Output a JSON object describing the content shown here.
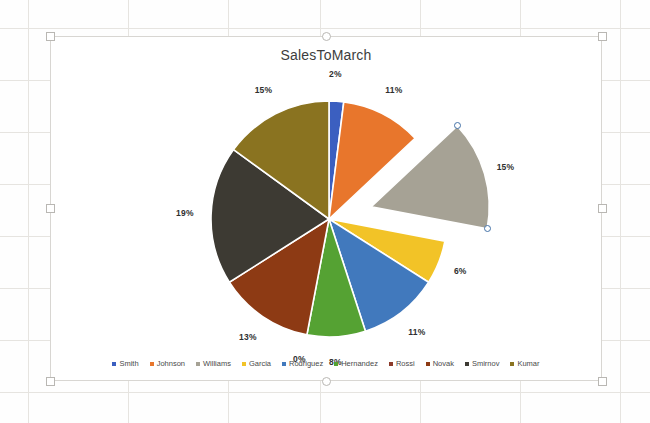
{
  "chart_data": {
    "type": "pie",
    "title": "SalesToMarch",
    "legend_position": "bottom",
    "categories": [
      "Smith",
      "Johnson",
      "Williams",
      "Garcia",
      "Rodriguez",
      "Hernandez",
      "Rossi",
      "Novak",
      "Smirnov",
      "Kumar"
    ],
    "values": [
      2,
      11,
      15,
      6,
      11,
      8,
      0,
      13,
      19,
      15
    ],
    "data_labels": [
      "2%",
      "11%",
      "15%",
      "6%",
      "11%",
      "8%",
      "0%",
      "13%",
      "19%",
      "15%"
    ],
    "colors": [
      "#3b5fc0",
      "#e8762c",
      "#a6a295",
      "#f2c327",
      "#4179bd",
      "#55a233",
      "#8c3a2a",
      "#8d3a14",
      "#3d3a33",
      "#8a7320"
    ],
    "exploded_slice": "Williams",
    "units": "percent"
  },
  "chart": {
    "title": "SalesToMarch",
    "slices": [
      {
        "name": "Smith",
        "label": "2%",
        "color": "#3b5fc0",
        "value": 2
      },
      {
        "name": "Johnson",
        "label": "11%",
        "color": "#e8762c",
        "value": 11
      },
      {
        "name": "Williams",
        "label": "15%",
        "color": "#a6a295",
        "value": 15
      },
      {
        "name": "Garcia",
        "label": "6%",
        "color": "#f2c327",
        "value": 6
      },
      {
        "name": "Rodriguez",
        "label": "11%",
        "color": "#4179bd",
        "value": 11
      },
      {
        "name": "Hernandez",
        "label": "8%",
        "color": "#55a233",
        "value": 8
      },
      {
        "name": "Rossi",
        "label": "0%",
        "color": "#8c3a2a",
        "value": 0
      },
      {
        "name": "Novak",
        "label": "13%",
        "color": "#8d3a14",
        "value": 13
      },
      {
        "name": "Smirnov",
        "label": "19%",
        "color": "#3d3a33",
        "value": 19
      },
      {
        "name": "Kumar",
        "label": "15%",
        "color": "#8a7320",
        "value": 15
      }
    ]
  },
  "selection": {
    "handle_color": "#4472a8",
    "object_handle_color": "#b9b7b3"
  }
}
